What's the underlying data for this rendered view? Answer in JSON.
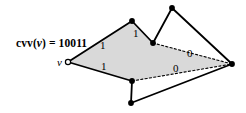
{
  "figure": {
    "kind": "graph-diagram",
    "background_color": "#ffffff",
    "stroke_color": "#000000",
    "fill_color": "#d9d9d9",
    "annotation": {
      "prefix": "cvv(",
      "variable": "v",
      "suffix": ") = ",
      "value": "10011",
      "full_text": "cvv(v) = 10011",
      "x": 16,
      "y": 38
    },
    "vertices": [
      {
        "id": "v",
        "name": "vertex-v",
        "x": 68,
        "y": 62,
        "style": "hollow",
        "label": "v",
        "label_x": 57,
        "label_y": 57
      },
      {
        "id": "p1",
        "name": "vertex-top-peak",
        "x": 132,
        "y": 21,
        "style": "filled",
        "label": ""
      },
      {
        "id": "p2",
        "name": "vertex-valley",
        "x": 153,
        "y": 43,
        "style": "filled",
        "label": ""
      },
      {
        "id": "p3",
        "name": "vertex-right-peak",
        "x": 172,
        "y": 8,
        "style": "filled",
        "label": ""
      },
      {
        "id": "p4",
        "name": "vertex-right",
        "x": 232,
        "y": 64,
        "style": "filled",
        "label": ""
      },
      {
        "id": "p5",
        "name": "vertex-bottom-mid",
        "x": 132,
        "y": 81,
        "style": "filled",
        "label": ""
      },
      {
        "id": "p6",
        "name": "vertex-bottom",
        "x": 131,
        "y": 103,
        "style": "filled",
        "label": ""
      }
    ],
    "filled_region": {
      "name": "shaded-polygon",
      "points": "68,62 132,21 153,43 232,64 132,81"
    },
    "edges": [
      {
        "name": "edge-v-to-top-peak",
        "from": "v",
        "to": "p1",
        "style": "solid",
        "weight": "1",
        "weight_x": 100,
        "weight_y": 40
      },
      {
        "name": "edge-v-to-bottom-mid",
        "from": "v",
        "to": "p5",
        "style": "solid",
        "weight": "1",
        "weight_x": 101,
        "weight_y": 61
      },
      {
        "name": "edge-top-peak-to-valley",
        "from": "p1",
        "to": "p2",
        "style": "solid",
        "weight": "1",
        "weight_x": 133,
        "weight_y": 28
      },
      {
        "name": "edge-valley-to-right-peak",
        "from": "p2",
        "to": "p3",
        "style": "solid",
        "weight": "",
        "weight_x": 0,
        "weight_y": 0
      },
      {
        "name": "edge-right-peak-to-right",
        "from": "p3",
        "to": "p4",
        "style": "solid",
        "weight": "",
        "weight_x": 0,
        "weight_y": 0
      },
      {
        "name": "edge-valley-to-right",
        "from": "p2",
        "to": "p4",
        "style": "dashed",
        "weight": "0",
        "weight_x": 187,
        "weight_y": 48
      },
      {
        "name": "edge-bottom-mid-to-right",
        "from": "p5",
        "to": "p4",
        "style": "dashed",
        "weight": "0",
        "weight_x": 173,
        "weight_y": 63
      },
      {
        "name": "edge-bottom-mid-to-bottom",
        "from": "p5",
        "to": "p6",
        "style": "solid",
        "weight": "",
        "weight_x": 0,
        "weight_y": 0
      },
      {
        "name": "edge-bottom-to-right",
        "from": "p6",
        "to": "p4",
        "style": "solid",
        "weight": "",
        "weight_x": 0,
        "weight_y": 0
      }
    ]
  }
}
